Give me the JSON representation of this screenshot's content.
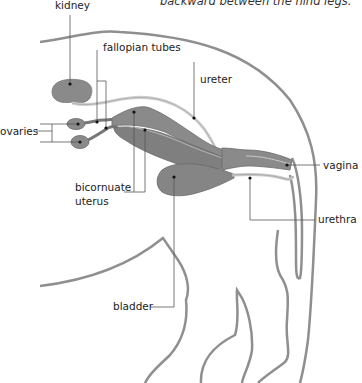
{
  "caption": "backward between the hind legs.",
  "labels": {
    "kidney": "kidney",
    "fallopian_tubes": "fallopian tubes",
    "ureter": "ureter",
    "ovaries": "ovaries",
    "bicornuate_uterus_line1": "bicornuate",
    "bicornuate_uterus_line2": "uterus",
    "vagina": "vagina",
    "urethra": "urethra",
    "bladder": "bladder"
  },
  "colors": {
    "organ_fill": "#8a8a8a",
    "organ_dark": "#6f6f6f",
    "outline": "#8c8c8c",
    "leader_line": "#555555",
    "text": "#222222"
  }
}
